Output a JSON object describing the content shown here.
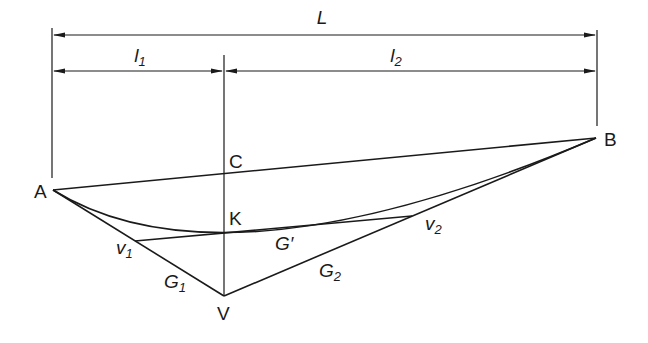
{
  "diagram": {
    "type": "vertical-curve-geometry",
    "dimensions": {
      "total_span_label": "L",
      "left_span_label": "l",
      "left_span_sub": "1",
      "right_span_label": "l",
      "right_span_sub": "2"
    },
    "points": {
      "A": "A",
      "B": "B",
      "C": "C",
      "K": "K",
      "V": "V",
      "v1": {
        "label": "v",
        "sub": "1"
      },
      "v2": {
        "label": "v",
        "sub": "2"
      }
    },
    "grades": {
      "G1": {
        "label": "G",
        "sub": "1"
      },
      "G2": {
        "label": "G",
        "sub": "2"
      },
      "Gprime": "G′"
    },
    "colors": {
      "line": "#1a1a1a",
      "background": "#ffffff"
    }
  }
}
